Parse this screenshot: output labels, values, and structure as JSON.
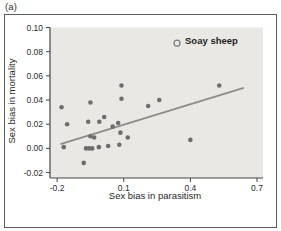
{
  "figure": {
    "panel_label": "(a)",
    "colors": {
      "plot_bg": "#e9e8e4",
      "dot": "#6e6e6e",
      "trend_line": "#8d8c88",
      "axis": "#454545",
      "tick_text": "#2b2b2b",
      "frame_border": "#5a5b5e",
      "highlight_stroke": "#7c7c7c"
    }
  },
  "chart_data": {
    "type": "scatter",
    "title": "",
    "xlabel": "Sex bias in parasitism",
    "ylabel": "Sex bias in mortality",
    "xlim": [
      -0.232,
      0.727
    ],
    "ylim": [
      -0.0245,
      0.1
    ],
    "grid": false,
    "legend": null,
    "x_ticks": {
      "values": [
        -0.2,
        0.1,
        0.4,
        0.7
      ],
      "labels": [
        "-0.2",
        "0.1",
        "0.4",
        "0.7"
      ]
    },
    "y_ticks": {
      "values": [
        0.1,
        0.08,
        0.06,
        0.04,
        0.02,
        0.0,
        -0.02
      ],
      "labels": [
        "0.10",
        "0.08",
        "0.06",
        "0.04",
        "0.02",
        "0.00",
        "-0.02"
      ]
    },
    "points": [
      [
        -0.18,
        0.034
      ],
      [
        -0.155,
        0.02
      ],
      [
        -0.17,
        0.001
      ],
      [
        -0.08,
        -0.012
      ],
      [
        -0.05,
        0.038
      ],
      [
        -0.06,
        0.022
      ],
      [
        -0.05,
        0.01
      ],
      [
        -0.033,
        0.009
      ],
      [
        -0.07,
        0.0
      ],
      [
        -0.056,
        0.0
      ],
      [
        -0.042,
        0.0
      ],
      [
        -0.012,
        0.001
      ],
      [
        -0.01,
        0.022
      ],
      [
        0.012,
        0.026
      ],
      [
        0.05,
        0.018
      ],
      [
        0.075,
        0.021
      ],
      [
        0.085,
        0.013
      ],
      [
        0.03,
        0.002
      ],
      [
        0.08,
        0.003
      ],
      [
        0.118,
        0.009
      ],
      [
        0.09,
        0.052
      ],
      [
        0.09,
        0.041
      ],
      [
        0.21,
        0.035
      ],
      [
        0.26,
        0.04
      ],
      [
        0.4,
        0.007
      ],
      [
        0.53,
        0.052
      ]
    ],
    "highlight_point": {
      "x": 0.34,
      "y": 0.087,
      "label": "Soay sheep",
      "style": "open-circle"
    },
    "trend_line": {
      "x1": -0.185,
      "y1": 0.0035,
      "x2": 0.64,
      "y2": 0.05
    }
  }
}
